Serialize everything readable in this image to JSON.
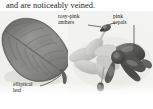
{
  "page": {
    "width": 153,
    "height": 109,
    "background_color": "#ffffff",
    "plate_background_color": "#f4f4f3",
    "text_color": "#231f20"
  },
  "caption": {
    "text": "and are noticeably veined."
  },
  "annotations": [
    {
      "id": "rosy-pink-anthers",
      "line1": "rosy-pink",
      "line2": "anthers",
      "target": "anther"
    },
    {
      "id": "pink-sepals",
      "line1": "pink",
      "line2": "sepals",
      "target": "sepal"
    },
    {
      "id": "elliptical-leaf",
      "line1": "elliptical",
      "line2": "leaf",
      "target": "leaf"
    }
  ],
  "photos": [
    {
      "id": "leaf-photo",
      "subject": "elliptical leaf",
      "palette": {
        "dark": "#5a5a58",
        "mid": "#7e7e7b",
        "light": "#9d9d99",
        "highlight": "#b4b4b0",
        "vein": "#6a6a67"
      }
    },
    {
      "id": "flower-photo",
      "subject": "flower with pink sepals and rosy-pink anthers",
      "palette": {
        "petal": "#cfcfcb",
        "petal_shade": "#b6b6b2",
        "sepal_dark": "#4e4e4c",
        "sepal_mid": "#6f6f6c",
        "anther_dark": "#3a3a38",
        "stalk": "#a9a9a5"
      }
    }
  ]
}
